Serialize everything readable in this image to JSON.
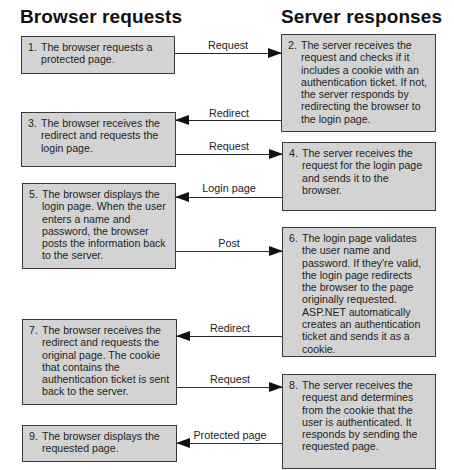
{
  "headers": {
    "browser": "Browser requests",
    "server": "Server responses"
  },
  "browser_steps": [
    {
      "num": "1.",
      "text": "The browser requests a protected page."
    },
    {
      "num": "3.",
      "text": "The browser receives the redirect and requests the login page."
    },
    {
      "num": "5.",
      "text": "The browser displays the login page. When the user enters a name and password, the browser posts the information back to the server."
    },
    {
      "num": "7.",
      "text": "The browser receives the redirect and requests the original page. The cookie that contains the authentication ticket is sent back to the server."
    },
    {
      "num": "9.",
      "text": "The browser displays the requested page."
    }
  ],
  "server_steps": [
    {
      "num": "2.",
      "text": "The server receives the request and checks if it includes a cookie with an authentication ticket. If not, the server responds by redirecting the browser to the login page."
    },
    {
      "num": "4.",
      "text": "The server receives the request for the login page and sends it to the browser."
    },
    {
      "num": "6.",
      "text": "The login page validates the user name and password. If they're valid, the login page redirects the browser to the page originally requested. ASP.NET automatically creates an authentication ticket and sends it as a cookie."
    },
    {
      "num": "8.",
      "text": "The server receives the request and determines from the cookie that the user is authenticated. It responds by sending the requested page."
    }
  ],
  "arrows": [
    {
      "label": "Request",
      "direction": "right"
    },
    {
      "label": "Redirect",
      "direction": "left"
    },
    {
      "label": "Request",
      "direction": "right"
    },
    {
      "label": "Login page",
      "direction": "left"
    },
    {
      "label": "Post",
      "direction": "right"
    },
    {
      "label": "Redirect",
      "direction": "left"
    },
    {
      "label": "Request",
      "direction": "right"
    },
    {
      "label": "Protected page",
      "direction": "left"
    }
  ],
  "colors": {
    "box_fill": "#d3d3d3",
    "box_border": "#3a3a3a",
    "arrow": "#111111"
  }
}
